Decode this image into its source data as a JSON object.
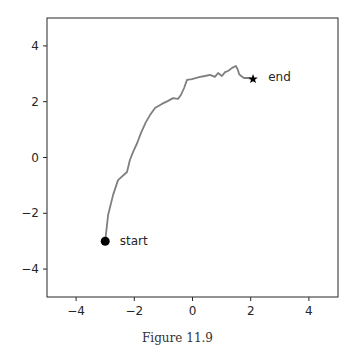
{
  "chart_data": {
    "type": "line",
    "title": "",
    "xlabel": "",
    "ylabel": "",
    "xlim": [
      -5,
      5
    ],
    "ylim": [
      -5,
      5
    ],
    "xticks": [
      -4,
      -2,
      0,
      2,
      4
    ],
    "yticks": [
      -4,
      -2,
      0,
      2,
      4
    ],
    "xtick_labels": [
      "−4",
      "−2",
      "0",
      "2",
      "4"
    ],
    "ytick_labels": [
      "−4",
      "−2",
      "0",
      "2",
      "4"
    ],
    "grid": false,
    "legend": null,
    "series": [
      {
        "name": "trajectory",
        "color": "#7f7f7f",
        "x": [
          -3.0,
          -2.9,
          -2.73,
          -2.56,
          -2.25,
          -2.15,
          -2.04,
          -1.9,
          -1.77,
          -1.6,
          -1.46,
          -1.29,
          -1.05,
          -0.84,
          -0.67,
          -0.5,
          -0.4,
          -0.29,
          -0.19,
          -0.02,
          0.26,
          0.43,
          0.6,
          0.77,
          0.88,
          1.01,
          1.12,
          1.22,
          1.36,
          1.49,
          1.56,
          1.6,
          1.67,
          1.77,
          1.91,
          2.08
        ],
        "y": [
          -3.0,
          -2.06,
          -1.34,
          -0.81,
          -0.52,
          -0.09,
          0.2,
          0.52,
          0.88,
          1.27,
          1.52,
          1.77,
          1.92,
          2.03,
          2.13,
          2.1,
          2.24,
          2.49,
          2.78,
          2.81,
          2.89,
          2.92,
          2.96,
          2.89,
          3.03,
          2.92,
          3.06,
          3.1,
          3.21,
          3.28,
          3.14,
          2.99,
          2.92,
          2.85,
          2.85,
          2.81
        ]
      }
    ],
    "markers": [
      {
        "name": "start",
        "shape": "circle",
        "x": -3.0,
        "y": -3.0,
        "color": "#000000"
      },
      {
        "name": "end",
        "shape": "star",
        "x": 2.08,
        "y": 2.81,
        "color": "#000000"
      }
    ],
    "annotations": [
      {
        "text": "start",
        "x": -2.5,
        "y": -3.0
      },
      {
        "text": "end",
        "x": 2.6,
        "y": 2.9
      }
    ]
  },
  "figure": {
    "caption": "Figure 11.9"
  }
}
